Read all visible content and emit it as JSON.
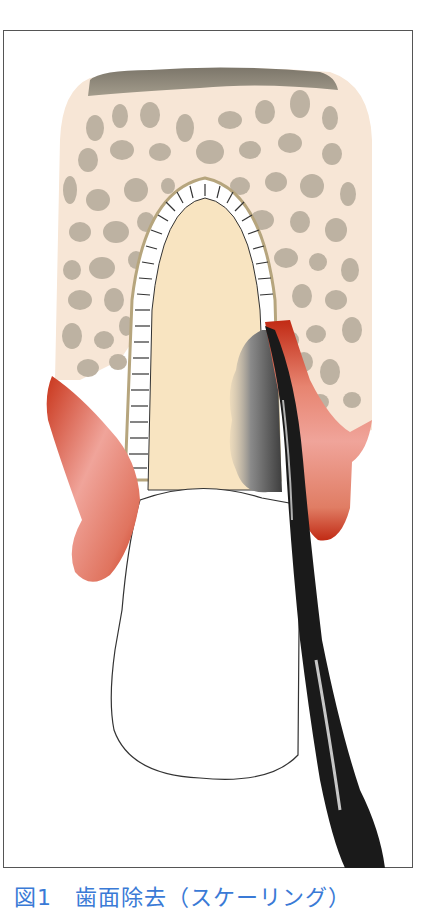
{
  "figure": {
    "caption": "図1　歯面除去（スケーリング）",
    "colors": {
      "frame_border": "#555555",
      "bone": "#f7e6d6",
      "bone_spots": "#bdb2a2",
      "cortical_cap": "#8d8677",
      "root_dentin": "#f8e4c1",
      "pdl_space": "#ffffff",
      "pdl_outline": "#b6a57d",
      "gingiva_dark": "#c9361c",
      "gingiva_light": "#f0a49a",
      "calculus": "#6f6f6f",
      "instrument": "#1a1a1a",
      "crown": "#ffffff",
      "caption_text": "#3a7ad6"
    },
    "labels": {
      "bone": "alveolar-bone",
      "root": "tooth-root",
      "crown": "tooth-crown",
      "gingiva_left": "inflamed-gingiva-left",
      "gingiva_right": "inflamed-gingiva-right",
      "calculus": "subgingival-calculus",
      "instrument": "scaler-curette"
    }
  }
}
